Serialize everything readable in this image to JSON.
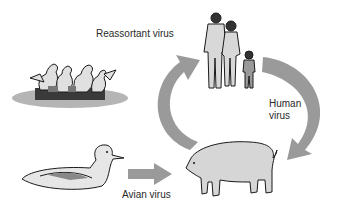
{
  "diagram": {
    "labels": {
      "reassortant": "Reassortant virus",
      "human_line1": "Human",
      "human_line2": "virus",
      "avian": "Avian virus"
    },
    "nodes": [
      {
        "id": "ducks-group",
        "icon": "duck-flock"
      },
      {
        "id": "human-family",
        "icon": "human-family"
      },
      {
        "id": "duck",
        "icon": "duck"
      },
      {
        "id": "pig",
        "icon": "pig"
      }
    ],
    "colors": {
      "arrow": "#9a9a9a",
      "shadow": "#b5b5b5",
      "outline": "#1a1a1a",
      "fill_light": "#d6d6d6"
    }
  }
}
